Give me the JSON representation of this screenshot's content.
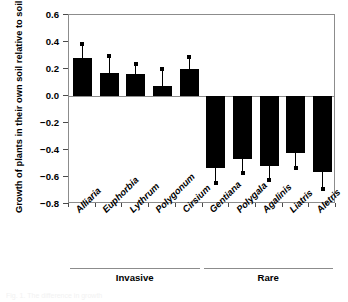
{
  "chart_data": {
    "type": "bar",
    "title": "",
    "subtitle": "",
    "xlabel": "",
    "ylabel": "Growth of plants in their own soil relative to soil from other species",
    "ylim": [
      -0.8,
      0.6
    ],
    "yticks": [
      0.6,
      0.4,
      0.2,
      0.0,
      -0.2,
      -0.4,
      -0.6,
      -0.8
    ],
    "ytick_labels": [
      "0.6",
      "0.4",
      "0.2",
      "0.0",
      "−0.2",
      "−0.4",
      "−0.6",
      "−0.8"
    ],
    "grid": false,
    "legend": "none",
    "zero_line": true,
    "bar_color": "#000000",
    "axis_color": "#8c8c8c",
    "categories": [
      "Alliaria",
      "Euphorbia",
      "Lythrum",
      "Polygonum",
      "Cirsium",
      "Gentiana",
      "Polygala",
      "Agalinis",
      "Liatris",
      "Aletris"
    ],
    "values": [
      0.28,
      0.17,
      0.16,
      0.075,
      0.2,
      -0.53,
      -0.47,
      -0.52,
      -0.42,
      -0.56
    ],
    "errors": [
      0.105,
      0.13,
      0.08,
      0.125,
      0.09,
      0.115,
      0.1,
      0.1,
      0.11,
      0.13
    ],
    "error_bar_direction": "away-from-zero",
    "groups": [
      {
        "label": "Invasive",
        "start_index": 0,
        "end_index": 4
      },
      {
        "label": "Rare",
        "start_index": 5,
        "end_index": 9
      }
    ]
  },
  "caption_sliver": "Fig. 1. The difference in growth"
}
